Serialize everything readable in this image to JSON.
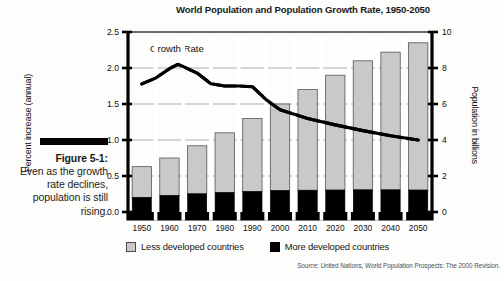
{
  "caption": {
    "figure_label": "Figure 5-1:",
    "text": "Even as the growth rate declines, population is still rising."
  },
  "legend": {
    "items": [
      {
        "label": "Less developed countries",
        "color": "#c9c9c9",
        "key": "less-developed"
      },
      {
        "label": "More developed countries",
        "color": "#000000",
        "key": "more-developed"
      }
    ]
  },
  "source": {
    "prefix": "Source:",
    "text": " United Nations, World Population Prospects: The 2000 Revision."
  },
  "chart_data": {
    "type": "bar",
    "title": "World Population and Population Growth Rate, 1950-2050",
    "categories": [
      "1950",
      "1960",
      "1970",
      "1980",
      "1990",
      "2000",
      "2010",
      "2020",
      "2030",
      "2040",
      "2050"
    ],
    "xlabel": "",
    "ylabel": "Percent increase (annual)",
    "y2label": "Population in billions",
    "ylim": [
      0.0,
      2.5
    ],
    "y2lim": [
      0,
      10
    ],
    "yticks": [
      "0.0",
      "0.5",
      "1.0",
      "1.5",
      "2.0",
      "2.5"
    ],
    "ytick_values": [
      0.0,
      0.5,
      1.0,
      1.5,
      2.0,
      2.5
    ],
    "y2ticks": [
      "0",
      "2",
      "4",
      "6",
      "8",
      "10"
    ],
    "y2tick_values": [
      0,
      2,
      4,
      6,
      8,
      10
    ],
    "grid": true,
    "grid_axis": "y",
    "legend_position": "bottom",
    "stacked": true,
    "series": [
      {
        "name": "More developed countries",
        "type": "bar",
        "axis": "right",
        "unit": "billions",
        "color": "#000000",
        "values": [
          0.81,
          0.92,
          1.01,
          1.08,
          1.14,
          1.19,
          1.21,
          1.22,
          1.23,
          1.23,
          1.22
        ]
      },
      {
        "name": "Less developed countries",
        "type": "bar",
        "axis": "right",
        "unit": "billions",
        "color": "#c9c9c9",
        "values": [
          1.71,
          2.08,
          2.67,
          3.32,
          4.06,
          4.81,
          5.59,
          6.38,
          7.17,
          7.65,
          8.18
        ]
      },
      {
        "name": "Total population",
        "type": "computed-total",
        "axis": "right",
        "unit": "billions",
        "values": [
          2.52,
          3.0,
          3.68,
          4.4,
          5.2,
          6.0,
          6.8,
          7.6,
          8.4,
          8.88,
          9.4
        ]
      },
      {
        "name": "Growth Rate",
        "type": "line",
        "axis": "left",
        "unit": "percent",
        "color": "#000000",
        "label": "Growth Rate",
        "x": [
          "1950",
          "1955",
          "1960",
          "1963",
          "1965",
          "1970",
          "1975",
          "1980",
          "1985",
          "1990",
          "1995",
          "2000",
          "2010",
          "2020",
          "2030",
          "2040",
          "2050"
        ],
        "values": [
          1.78,
          1.86,
          1.99,
          2.05,
          2.02,
          1.93,
          1.78,
          1.75,
          1.75,
          1.74,
          1.56,
          1.42,
          1.3,
          1.21,
          1.13,
          1.06,
          1.0
        ]
      }
    ]
  }
}
